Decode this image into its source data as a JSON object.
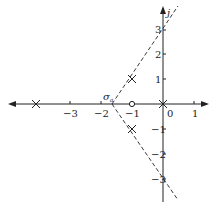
{
  "diagram": {
    "type": "root-locus",
    "axes": {
      "real_ticks": [
        {
          "v": -3,
          "label": "−3"
        },
        {
          "v": -2,
          "label": "−2"
        },
        {
          "v": -1,
          "label": "−1"
        },
        {
          "v": 0,
          "label": "0"
        },
        {
          "v": 1,
          "label": "1"
        }
      ],
      "imag_ticks": [
        {
          "v": 3,
          "label": "3"
        },
        {
          "v": 2,
          "label": "2"
        },
        {
          "v": 1,
          "label": "1"
        },
        {
          "v": -1,
          "label": "−1"
        },
        {
          "v": -2,
          "label": "−2"
        },
        {
          "v": -3,
          "label": "−3"
        }
      ],
      "imag_label": "j"
    },
    "poles": [
      {
        "re": -4,
        "im": 0
      },
      {
        "re": 0,
        "im": 0
      },
      {
        "re": -1,
        "im": 1
      },
      {
        "re": -1,
        "im": -1
      }
    ],
    "zeros": [
      {
        "re": -1,
        "im": 0
      }
    ],
    "centroid": {
      "label": "σa",
      "re": -1.67
    },
    "asymptotes": [
      {
        "from": -1.67,
        "through_im": 3
      },
      {
        "from": -1.67,
        "through_im": -3
      }
    ]
  }
}
